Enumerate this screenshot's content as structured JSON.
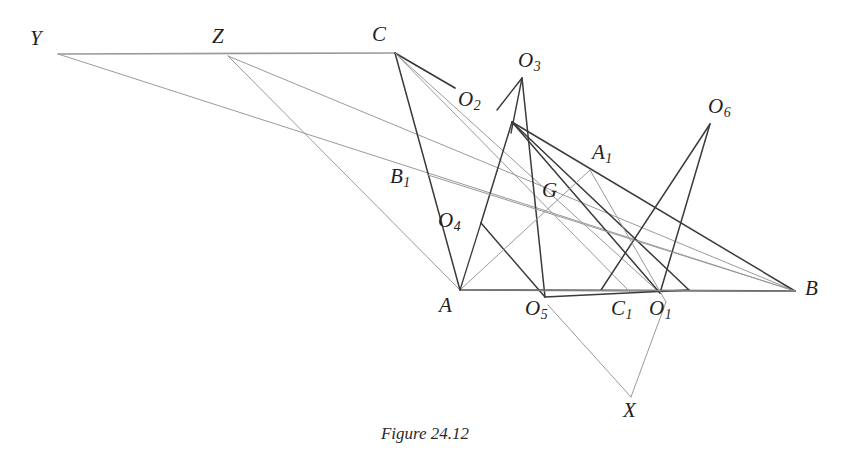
{
  "figure": {
    "caption": "Figure 24.12",
    "width": 850,
    "height": 466,
    "background": "#ffffff",
    "stroke_dark": "#3a3a3a",
    "stroke_light": "#9a9a9a",
    "label_color": "#1f1f1f"
  },
  "labels": {
    "Y": {
      "text": "Y",
      "sub": "",
      "x": 30,
      "y": 28
    },
    "Z": {
      "text": "Z",
      "sub": "",
      "x": 212,
      "y": 26
    },
    "C": {
      "text": "C",
      "sub": "",
      "x": 372,
      "y": 24
    },
    "O3": {
      "text": "O",
      "sub": "3",
      "x": 518,
      "y": 50
    },
    "O2": {
      "text": "O",
      "sub": "2",
      "x": 458,
      "y": 89
    },
    "O6": {
      "text": "O",
      "sub": "6",
      "x": 708,
      "y": 96
    },
    "A1": {
      "text": "A",
      "sub": "1",
      "x": 592,
      "y": 142
    },
    "B1": {
      "text": "B",
      "sub": "1",
      "x": 390,
      "y": 166
    },
    "G": {
      "text": "G",
      "sub": "",
      "x": 542,
      "y": 180
    },
    "O4": {
      "text": "O",
      "sub": "4",
      "x": 438,
      "y": 210
    },
    "A": {
      "text": "A",
      "sub": "",
      "x": 439,
      "y": 295
    },
    "O5": {
      "text": "O",
      "sub": "5",
      "x": 525,
      "y": 298
    },
    "C1": {
      "text": "C",
      "sub": "1",
      "x": 611,
      "y": 298
    },
    "O1": {
      "text": "O",
      "sub": "1",
      "x": 649,
      "y": 298
    },
    "B": {
      "text": "B",
      "sub": "",
      "x": 805,
      "y": 278
    },
    "X": {
      "text": "X",
      "sub": "",
      "x": 623,
      "y": 400
    }
  },
  "points": {
    "Y": [
      58,
      54
    ],
    "Z": [
      228,
      56
    ],
    "C": [
      395,
      53
    ],
    "A": [
      460,
      290
    ],
    "B": [
      795,
      291
    ],
    "O1": [
      660,
      293
    ],
    "O2": [
      504,
      112
    ],
    "O3": [
      522,
      78
    ],
    "O4": [
      481,
      223
    ],
    "O5": [
      545,
      297
    ],
    "O6": [
      710,
      124
    ],
    "A1": [
      590,
      170
    ],
    "B1": [
      428,
      175
    ],
    "C1": [
      630,
      292
    ],
    "G": [
      557,
      203
    ],
    "X": [
      631,
      397
    ],
    "P_CO2": [
      455,
      88
    ],
    "P_Q_TOP": [
      512,
      122
    ],
    "P_Q_RIGHT": [
      689,
      290
    ],
    "P_O3_LEFT": [
      497,
      110
    ],
    "P_O3_DOWN": [
      511,
      133
    ],
    "P_O6_LEFT": [
      601,
      290
    ],
    "P_X_LEFT": [
      548,
      305
    ],
    "P_X_RIGHT": [
      666,
      302
    ]
  },
  "segments": [
    {
      "name": "segment-Y-C-baseline-top",
      "from": "Y",
      "to": "C",
      "tone": "light",
      "width": 1.6
    },
    {
      "name": "segment-Y-B",
      "from": "Y",
      "to": "B",
      "tone": "light",
      "width": 1.0
    },
    {
      "name": "segment-Z-A",
      "from": "Z",
      "to": "A",
      "tone": "light",
      "width": 1.0
    },
    {
      "name": "segment-Z-B",
      "from": "Z",
      "to": "B",
      "tone": "light",
      "width": 1.0
    },
    {
      "name": "segment-A-B-baseline",
      "from": "A",
      "to": "B",
      "tone": "dark",
      "width": 1.7
    },
    {
      "name": "segment-C-A",
      "from": "C",
      "to": "A",
      "tone": "dark",
      "width": 1.5
    },
    {
      "name": "segment-C-O2-stub",
      "from": "C",
      "to": "P_CO2",
      "tone": "dark",
      "width": 1.7
    },
    {
      "name": "segment-C-C1",
      "from": "C",
      "to": "C1",
      "tone": "light",
      "width": 1.0
    },
    {
      "name": "segment-C-O1",
      "from": "C",
      "to": "O1",
      "tone": "light",
      "width": 1.0
    },
    {
      "name": "segment-O3-left-leg",
      "from": "O3",
      "to": "P_O3_LEFT",
      "tone": "dark",
      "width": 1.4
    },
    {
      "name": "segment-O3-down-leg",
      "from": "O3",
      "to": "P_O3_DOWN",
      "tone": "dark",
      "width": 1.4
    },
    {
      "name": "segment-O3-O5",
      "from": "O3",
      "to": "O5",
      "tone": "dark",
      "width": 1.5
    },
    {
      "name": "segment-quad-top-O4",
      "from": "P_Q_TOP",
      "to": "O4",
      "tone": "dark",
      "width": 1.5
    },
    {
      "name": "segment-quad-O4-O5",
      "from": "O4",
      "to": "O5",
      "tone": "dark",
      "width": 1.5
    },
    {
      "name": "segment-quad-O5-right",
      "from": "O5",
      "to": "P_Q_RIGHT",
      "tone": "dark",
      "width": 1.5
    },
    {
      "name": "segment-quad-top-right",
      "from": "P_Q_TOP",
      "to": "P_Q_RIGHT",
      "tone": "dark",
      "width": 1.5
    },
    {
      "name": "segment-O2-B",
      "from": "P_Q_TOP",
      "to": "B",
      "tone": "dark",
      "width": 1.5
    },
    {
      "name": "segment-O2-O1",
      "from": "P_Q_TOP",
      "to": "O1",
      "tone": "dark",
      "width": 1.5
    },
    {
      "name": "segment-O6-left-leg",
      "from": "O6",
      "to": "P_O6_LEFT",
      "tone": "dark",
      "width": 1.5
    },
    {
      "name": "segment-O6-O1",
      "from": "O6",
      "to": "O1",
      "tone": "dark",
      "width": 1.5
    },
    {
      "name": "segment-A-A1-B",
      "from": "A",
      "to": "A1",
      "tone": "light",
      "width": 1.0
    },
    {
      "name": "segment-A1-G-extend",
      "from": "A1",
      "to": "P_X_RIGHT",
      "tone": "light",
      "width": 1.0
    },
    {
      "name": "segment-A-G-B",
      "from": "A",
      "to": "B",
      "tone": "light",
      "width": 0.9
    },
    {
      "name": "segment-X-left-leg",
      "from": "X",
      "to": "P_X_LEFT",
      "tone": "light",
      "width": 1.0
    },
    {
      "name": "segment-X-right-leg",
      "from": "X",
      "to": "P_X_RIGHT",
      "tone": "light",
      "width": 1.0
    },
    {
      "name": "segment-O4-A",
      "from": "O4",
      "to": "A",
      "tone": "dark",
      "width": 1.3
    },
    {
      "name": "segment-B1-B",
      "from": "B1",
      "to": "B",
      "tone": "light",
      "width": 1.0
    }
  ]
}
